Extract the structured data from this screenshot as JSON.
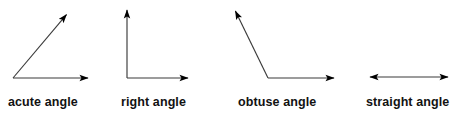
{
  "figure": {
    "background_color": "#ffffff",
    "width": 462,
    "height": 115,
    "stroke_color": "#3a3a3a",
    "arrow_fill_color": "#000000",
    "label_color": "#121212"
  },
  "diagrams": [
    {
      "id": "acute-angle",
      "label": "acute angle",
      "angle_degrees": 40,
      "vertex": {
        "x": 13,
        "y": 78
      },
      "rays": [
        {
          "name": "horizontal-ray",
          "to": {
            "x": 92,
            "y": 78
          },
          "arrowhead": "end"
        },
        {
          "name": "diagonal-ray",
          "to": {
            "x": 70,
            "y": 10
          },
          "arrowhead": "end"
        }
      ]
    },
    {
      "id": "right-angle",
      "label": "right angle",
      "angle_degrees": 90,
      "vertex": {
        "x": 127,
        "y": 78
      },
      "rays": [
        {
          "name": "horizontal-ray",
          "to": {
            "x": 192,
            "y": 78
          },
          "arrowhead": "end"
        },
        {
          "name": "vertical-ray",
          "to": {
            "x": 127,
            "y": 5
          },
          "arrowhead": "end"
        }
      ]
    },
    {
      "id": "obtuse-angle",
      "label": "obtuse angle",
      "angle_degrees": 115,
      "vertex": {
        "x": 268,
        "y": 78
      },
      "rays": [
        {
          "name": "horizontal-ray",
          "to": {
            "x": 338,
            "y": 78
          },
          "arrowhead": "end"
        },
        {
          "name": "upper-left-ray",
          "to": {
            "x": 233,
            "y": 6
          },
          "arrowhead": "end"
        }
      ]
    },
    {
      "id": "straight-angle",
      "label": "straight angle",
      "angle_degrees": 180,
      "vertex": {
        "x": 409,
        "y": 77
      },
      "rays": [
        {
          "name": "left-ray",
          "to": {
            "x": 366,
            "y": 77
          },
          "arrowhead": "end"
        },
        {
          "name": "right-ray",
          "to": {
            "x": 452,
            "y": 77
          },
          "arrowhead": "end"
        }
      ]
    }
  ],
  "labels": {
    "acute": "acute angle",
    "right": "right angle",
    "obtuse": "obtuse angle",
    "straight": "straight angle"
  }
}
